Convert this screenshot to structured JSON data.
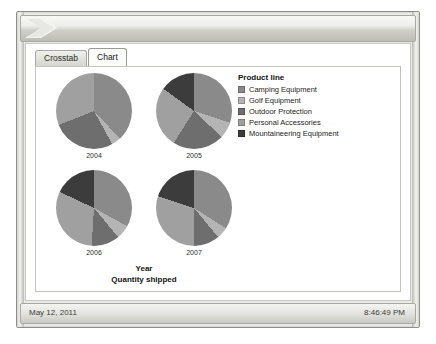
{
  "window": {
    "title": "",
    "chevron_icon": "chevron-right-icon"
  },
  "tabs": [
    {
      "label": "Crosstab",
      "active": false
    },
    {
      "label": "Chart",
      "active": true
    }
  ],
  "status_bar": {
    "date": "May 12, 2011",
    "time": "8:46:49 PM"
  },
  "legend": {
    "title": "Product line",
    "items": [
      {
        "label": "Camping Equipment",
        "color": "#8a8a8a"
      },
      {
        "label": "Golf Equipment",
        "color": "#b4b4b4"
      },
      {
        "label": "Outdoor Protection",
        "color": "#6e6e6e"
      },
      {
        "label": "Personal Accessories",
        "color": "#a0a0a0"
      },
      {
        "label": "Mountaineering Equipment",
        "color": "#3c3c3c"
      }
    ]
  },
  "chart_data": {
    "type": "pie",
    "title": "",
    "xlabel": "Year",
    "ylabel": "Quantity shipped",
    "legend_title": "Product line",
    "legend_position": "right",
    "grid": false,
    "categories": [
      "Camping Equipment",
      "Golf Equipment",
      "Outdoor Protection",
      "Personal Accessories",
      "Mountaineering Equipment"
    ],
    "colors": [
      "#8a8a8a",
      "#b4b4b4",
      "#6e6e6e",
      "#a0a0a0",
      "#3c3c3c"
    ],
    "panels": [
      {
        "label": "2004",
        "values": [
          38,
          4,
          27,
          31,
          0
        ],
        "slices": [
          {
            "name": "Camping Equipment",
            "percent": 38,
            "color": "#8a8a8a"
          },
          {
            "name": "Golf Equipment",
            "percent": 4,
            "color": "#b4b4b4"
          },
          {
            "name": "Outdoor Protection",
            "percent": 27,
            "color": "#6e6e6e"
          },
          {
            "name": "Personal Accessories",
            "percent": 31,
            "color": "#a0a0a0"
          },
          {
            "name": "Mountaineering Equipment",
            "percent": 0,
            "color": "#3c3c3c"
          }
        ]
      },
      {
        "label": "2005",
        "values": [
          30,
          7,
          22,
          26,
          15
        ],
        "slices": [
          {
            "name": "Camping Equipment",
            "percent": 30,
            "color": "#8a8a8a"
          },
          {
            "name": "Golf Equipment",
            "percent": 7,
            "color": "#b4b4b4"
          },
          {
            "name": "Outdoor Protection",
            "percent": 22,
            "color": "#6e6e6e"
          },
          {
            "name": "Personal Accessories",
            "percent": 26,
            "color": "#a0a0a0"
          },
          {
            "name": "Mountaineering Equipment",
            "percent": 15,
            "color": "#3c3c3c"
          }
        ]
      },
      {
        "label": "2006",
        "values": [
          33,
          6,
          12,
          31,
          18
        ],
        "slices": [
          {
            "name": "Camping Equipment",
            "percent": 33,
            "color": "#8a8a8a"
          },
          {
            "name": "Golf Equipment",
            "percent": 6,
            "color": "#b4b4b4"
          },
          {
            "name": "Outdoor Protection",
            "percent": 12,
            "color": "#6e6e6e"
          },
          {
            "name": "Personal Accessories",
            "percent": 31,
            "color": "#a0a0a0"
          },
          {
            "name": "Mountaineering Equipment",
            "percent": 18,
            "color": "#3c3c3c"
          }
        ]
      },
      {
        "label": "2007",
        "values": [
          34,
          5,
          11,
          30,
          20
        ],
        "slices": [
          {
            "name": "Camping Equipment",
            "percent": 34,
            "color": "#8a8a8a"
          },
          {
            "name": "Golf Equipment",
            "percent": 5,
            "color": "#b4b4b4"
          },
          {
            "name": "Outdoor Protection",
            "percent": 11,
            "color": "#6e6e6e"
          },
          {
            "name": "Personal Accessories",
            "percent": 30,
            "color": "#a0a0a0"
          },
          {
            "name": "Mountaineering Equipment",
            "percent": 20,
            "color": "#3c3c3c"
          }
        ]
      }
    ]
  }
}
